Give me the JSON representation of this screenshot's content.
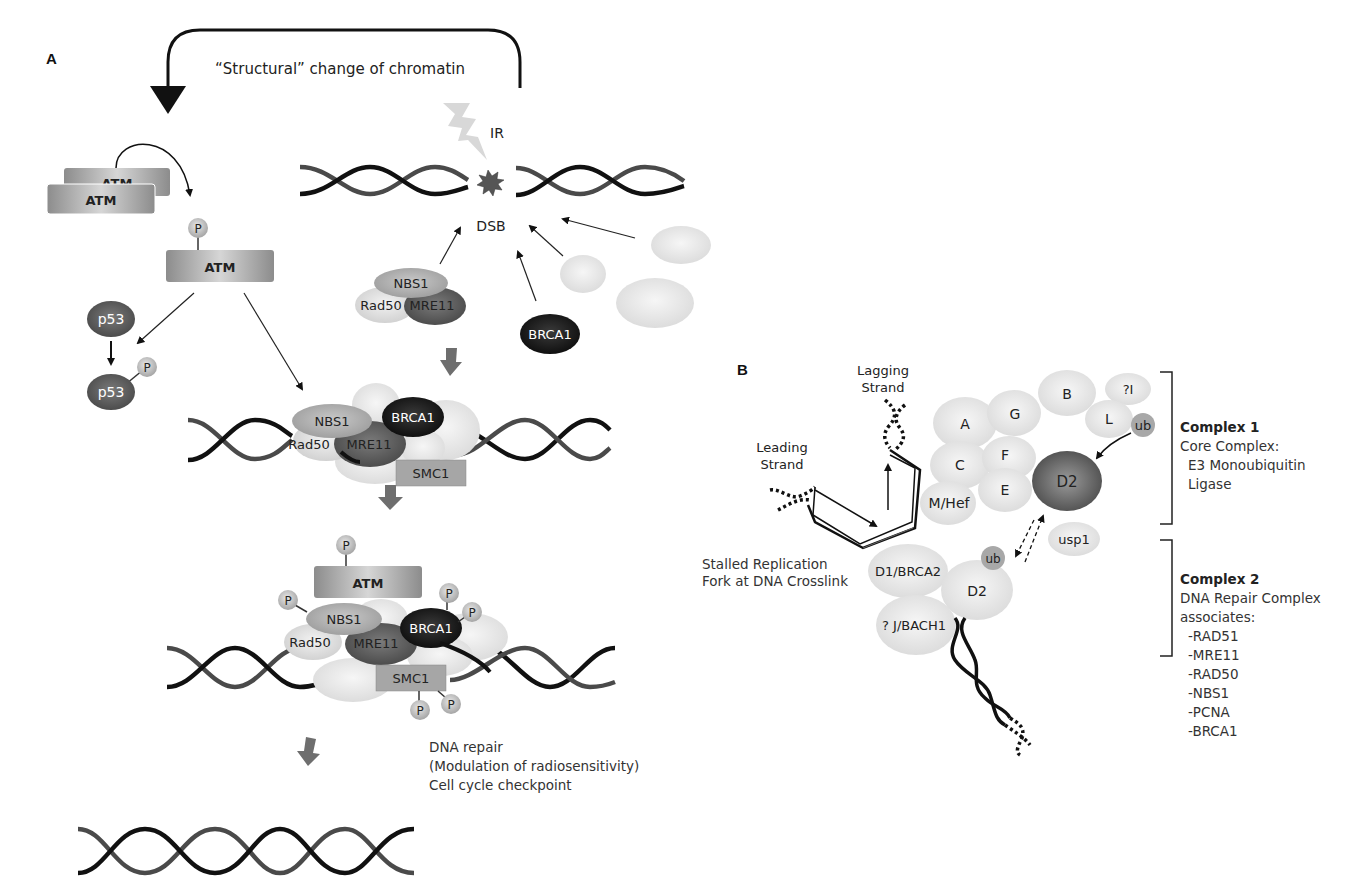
{
  "panel_a": {
    "label": "A",
    "feedback_label": "“Structural” change of chromatin",
    "ir_label": "IR",
    "dsb_label": "DSB",
    "atm_dimer": [
      "ATM",
      "ATM"
    ],
    "atm_active": "ATM",
    "phospho": "P",
    "p53": "p53",
    "p53_phos": "p53",
    "mrn_free": {
      "nbs1": "NBS1",
      "rad50": "Rad50",
      "mre11": "MRE11"
    },
    "brca1_free": "BRCA1",
    "complex1": {
      "nbs1": "NBS1",
      "rad50": "Rad50",
      "mre11": "MRE11",
      "brca1": "BRCA1",
      "smc1": "SMC1"
    },
    "complex2": {
      "atm": "ATM",
      "nbs1": "NBS1",
      "rad50": "Rad50",
      "mre11": "MRE11",
      "brca1": "BRCA1",
      "smc1": "SMC1"
    },
    "outcomes": [
      "DNA repair",
      "(Modulation of radiosensitivity)",
      "Cell cycle checkpoint"
    ]
  },
  "panel_b": {
    "label": "B",
    "lagging_strand": [
      "Lagging",
      "Strand"
    ],
    "leading_strand": [
      "Leading",
      "Strand"
    ],
    "stalled_fork": [
      "Stalled Replication",
      "Fork at DNA Crosslink"
    ],
    "core_proteins": [
      "A",
      "G",
      "B",
      "?I",
      "L",
      "C",
      "F",
      "E",
      "M/Hef"
    ],
    "ub": "ub",
    "d2": "D2",
    "usp1": "usp1",
    "d1_brca2": "D1/BRCA2",
    "d2_repair": "D2",
    "j_bach1": "? J/BACH1",
    "complex1": {
      "title": "Complex 1",
      "lines": [
        "Core Complex:",
        "E3 Monoubiquitin",
        "Ligase"
      ]
    },
    "complex2": {
      "title": "Complex 2",
      "lines": [
        "DNA Repair Complex",
        "associates:"
      ],
      "members": [
        "-RAD51",
        "-MRE11",
        "-RAD50",
        "-NBS1",
        "-PCNA",
        "-BRCA1"
      ]
    }
  },
  "colors": {
    "dna_dark": "#111111",
    "dna_mid": "#4a4a4a",
    "protein_light": "#dcdcdc",
    "protein_mid": "#a9a9a9",
    "protein_dark": "#4b4b4b",
    "protein_black": "#151515",
    "atm_gray": "#9a9a9a",
    "arrow_gray": "#6e6e6e",
    "lightning": "#d8d8d8"
  }
}
